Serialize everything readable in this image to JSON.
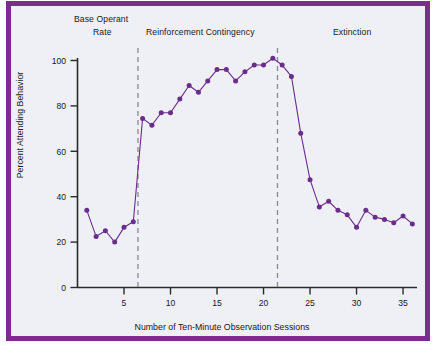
{
  "figure": {
    "border_color": "#7b2d8e",
    "background_color": "#eef0f6",
    "series_color": "#6b2d8c"
  },
  "phases": {
    "base_line1": "Base Operant",
    "base_line2": "Rate",
    "reinforcement": "Reinforcement Contingency",
    "extinction": "Extinction"
  },
  "chart_data": {
    "type": "line",
    "title": "",
    "xlabel": "Number of Ten-Minute Observation Sessions",
    "ylabel": "Percent Attending Behavior",
    "xlim": [
      0,
      36.5
    ],
    "ylim": [
      0,
      100
    ],
    "xticks": [
      5,
      10,
      15,
      20,
      25,
      30,
      35
    ],
    "yticks": [
      0,
      20,
      40,
      60,
      80,
      100
    ],
    "grid": false,
    "legend": "none",
    "marker": "circle",
    "x": [
      1,
      2,
      3,
      4,
      5,
      6,
      7,
      8,
      9,
      10,
      11,
      12,
      13,
      14,
      15,
      16,
      17,
      18,
      19,
      20,
      21,
      22,
      23,
      24,
      25,
      26,
      27,
      28,
      29,
      30,
      31,
      32,
      33,
      34,
      35,
      36
    ],
    "values": [
      34,
      22.5,
      25,
      20,
      26.5,
      29,
      74.5,
      71.5,
      77,
      77,
      83,
      89,
      86,
      91,
      96,
      96,
      91,
      95,
      98,
      98,
      101,
      98,
      93,
      68,
      47.5,
      35.5,
      38,
      34,
      32,
      26.5,
      34,
      31,
      30,
      28.5,
      31.5,
      28
    ],
    "series": [
      {
        "name": "Percent Attending Behavior",
        "values": [
          34,
          22.5,
          25,
          20,
          26.5,
          29,
          74.5,
          71.5,
          77,
          77,
          83,
          89,
          86,
          91,
          96,
          96,
          91,
          95,
          98,
          98,
          101,
          98,
          93,
          68,
          47.5,
          35.5,
          38,
          34,
          32,
          26.5,
          34,
          31,
          30,
          28.5,
          31.5,
          28
        ]
      }
    ],
    "phase_dividers": [
      6.5,
      21.5
    ],
    "phase_spans": [
      {
        "label": "Base Operant Rate",
        "from": 0.5,
        "to": 6.5
      },
      {
        "label": "Reinforcement Contingency",
        "from": 6.5,
        "to": 21.5
      },
      {
        "label": "Extinction",
        "from": 21.5,
        "to": 36.5
      }
    ]
  }
}
